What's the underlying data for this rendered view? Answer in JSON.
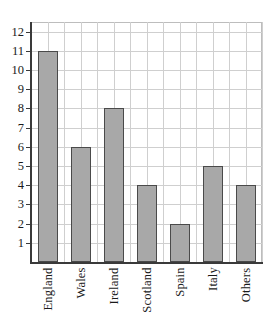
{
  "chart_data": {
    "type": "bar",
    "title": "",
    "subtitle": "",
    "xlabel": "",
    "ylabel": "",
    "categories": [
      "England",
      "Wales",
      "Ireland",
      "Scotland",
      "Spain",
      "Italy",
      "Others"
    ],
    "values": [
      11,
      6,
      8,
      4,
      2,
      5,
      4
    ],
    "ylim": [
      0,
      12.5
    ],
    "y_ticks": [
      12,
      11,
      10,
      9,
      8,
      7,
      6,
      5,
      4,
      3,
      2,
      1
    ],
    "y_tick_labels": [
      "12",
      "11",
      "10",
      "9",
      "8",
      "7",
      "6",
      "5",
      "4",
      "3",
      "2",
      "1"
    ],
    "grid": true,
    "grid_axis": "both",
    "legend": false,
    "legend_position": "none",
    "annotations": []
  },
  "style": {
    "bar_fill": "#a8a8a8",
    "bar_stroke": "#4a4a4a",
    "grid_color": "#cfcfcf",
    "axis_color": "#3a3a3a",
    "background": "#ffffff",
    "text_color": "#1a1a1a"
  }
}
